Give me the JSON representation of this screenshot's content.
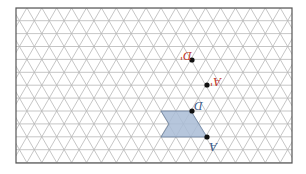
{
  "diagram": {
    "type": "isometric-triangle-grid",
    "frame": {
      "x": 16,
      "y": 8,
      "width": 276,
      "height": 155,
      "stroke": "#555555"
    },
    "grid": {
      "row_height": 12.9,
      "col_width": 14.9,
      "line_color": "#b8b8b8"
    },
    "shape": {
      "fill": "#a9bcd6",
      "stroke": "#6a7f9c",
      "points": [
        [
          161,
          111
        ],
        [
          191,
          111
        ],
        [
          207,
          137
        ],
        [
          161,
          137
        ],
        [
          169,
          124
        ]
      ]
    },
    "points": [
      {
        "id": "D-image",
        "label": "D'",
        "x": 192,
        "y": 60,
        "label_x": 180,
        "label_y": 50,
        "label_color": "#c0392b"
      },
      {
        "id": "A-image",
        "label": "A'",
        "x": 207,
        "y": 85,
        "label_x": 210,
        "label_y": 76,
        "label_color": "#c0392b"
      },
      {
        "id": "D",
        "label": "D",
        "x": 192,
        "y": 111,
        "label_x": 194,
        "label_y": 100,
        "label_color": "#3a5a8c"
      },
      {
        "id": "A",
        "label": "A",
        "x": 207,
        "y": 137,
        "label_x": 209,
        "label_y": 141,
        "label_color": "#3a5a8c"
      }
    ]
  }
}
